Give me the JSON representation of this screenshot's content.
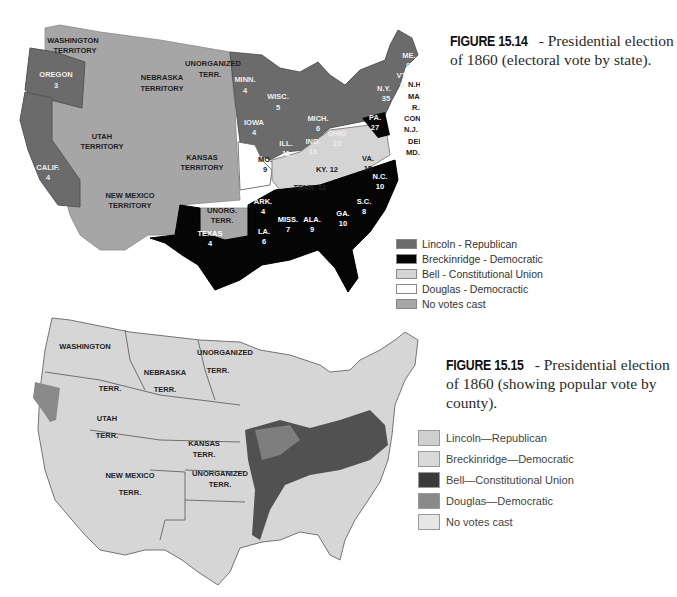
{
  "figure_15_14": {
    "number": "FIGURE 15.14",
    "caption": " - Presidential election of 1860 (electoral vote by state).",
    "legend": [
      {
        "label": "Lincoln - Republican",
        "color": "#6b6b6b"
      },
      {
        "label": "Breckinridge - Democratic",
        "color": "#050505"
      },
      {
        "label": "Bell - Constitutional Union",
        "color": "#d4d4d4"
      },
      {
        "label": "Douglas - Democractic",
        "color": "#ffffff"
      },
      {
        "label": "No votes cast",
        "color": "#a6a6a6"
      }
    ],
    "labels": {
      "washington": [
        "WASHINGTON",
        "TERRITORY"
      ],
      "oregon": [
        "OREGON",
        "3"
      ],
      "nebraska": [
        "NEBRASKA",
        "TERRITORY"
      ],
      "unorganized_north": [
        "UNORGANIZED",
        "TERR."
      ],
      "utah": [
        "UTAH",
        "TERRITORY"
      ],
      "calif": [
        "CALIF.",
        "4"
      ],
      "kansas": [
        "KANSAS",
        "TERRITORY"
      ],
      "new_mexico": [
        "NEW MEXICO",
        "TERRITORY"
      ],
      "unorg_south": [
        "UNORG.",
        "TERR."
      ],
      "texas": [
        "TEXAS",
        "4"
      ],
      "minn": [
        "MINN.",
        "4"
      ],
      "iowa": [
        "IOWA",
        "4"
      ],
      "wisc": [
        "WISC.",
        "5"
      ],
      "mich": [
        "MICH.",
        "6"
      ],
      "ill": [
        "ILL.",
        "11"
      ],
      "ind": [
        "IND.",
        "13"
      ],
      "ohio": [
        "OHIO",
        "23"
      ],
      "pa": [
        "PA.",
        "27"
      ],
      "ny": [
        "N.Y.",
        "35"
      ],
      "vt": [
        "VT.",
        "5"
      ],
      "me": [
        "ME.",
        "8"
      ],
      "nh": "N.H. 5",
      "mass": "MASS. 13",
      "ri": "R.I. 4",
      "conn": "CONN. 6",
      "nj": "N.J. 4&3",
      "del": "DEL. 3",
      "md": "MD. 8",
      "mo": [
        "MO.",
        "9"
      ],
      "ky": "KY. 12",
      "va": [
        "VA.",
        "15"
      ],
      "tenn": "TENN. 12",
      "nc": [
        "N.C.",
        "10"
      ],
      "sc": [
        "S.C.",
        "8"
      ],
      "ga": [
        "GA.",
        "10"
      ],
      "ala": [
        "ALA.",
        "9"
      ],
      "miss": [
        "MISS.",
        "7"
      ],
      "la": [
        "LA.",
        "6"
      ],
      "ark": [
        "ARK.",
        "4"
      ],
      "fla": [
        "FLA.",
        "3"
      ]
    }
  },
  "figure_15_15": {
    "number": "FIGURE 15.15",
    "caption": " - Presidential election of 1860 (showing popular vote by county).",
    "legend": [
      {
        "label": "Lincoln—Republican",
        "color": "#cfcfcf"
      },
      {
        "label": "Breckinridge—Democratic",
        "color": "#d9d9d9"
      },
      {
        "label": "Bell—Constitutional Union",
        "color": "#3a3a3a"
      },
      {
        "label": "Douglas—Democratic",
        "color": "#8a8a8a"
      },
      {
        "label": "No votes cast",
        "color": "#e6e6e6"
      }
    ],
    "labels": {
      "washington": "WASHINGTON",
      "wa_terr": "TERR.",
      "nebraska": "NEBRASKA",
      "ne_terr": "TERR.",
      "unorganized_north": "UNORGANIZED",
      "un_terr": "TERR.",
      "utah": "UTAH",
      "ut_terr": "TERR.",
      "kansas": "KANSAS",
      "ks_terr": "TERR.",
      "new_mexico": "NEW MEXICO",
      "nm_terr": "TERR.",
      "unorganized_south": "UNORGANIZED",
      "us_terr": "TERR."
    }
  }
}
